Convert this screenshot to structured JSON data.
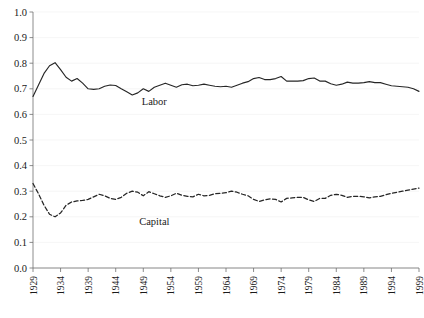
{
  "chart_data": {
    "type": "line",
    "title": "",
    "subtitle": "",
    "xlabel": "",
    "ylabel": "",
    "xlim": [
      1929,
      1999
    ],
    "ylim": [
      0.0,
      1.0
    ],
    "grid": true,
    "grid_axis": "y",
    "legend": "inline-annotations",
    "legend_position": "inside-plot",
    "y_ticks": [
      "0.0",
      "0.1",
      "0.2",
      "0.3",
      "0.4",
      "0.5",
      "0.6",
      "0.7",
      "0.8",
      "0.9",
      "1.0"
    ],
    "y_tick_values": [
      0.0,
      0.1,
      0.2,
      0.3,
      0.4,
      0.5,
      0.6,
      0.7,
      0.8,
      0.9,
      1.0
    ],
    "x_ticks": [
      "1929",
      "1934",
      "1939",
      "1944",
      "1949",
      "1954",
      "1959",
      "1964",
      "1969",
      "1974",
      "1979",
      "1984",
      "1989",
      "1994",
      "1999"
    ],
    "x_tick_values": [
      1929,
      1934,
      1939,
      1944,
      1949,
      1954,
      1959,
      1964,
      1969,
      1974,
      1979,
      1984,
      1989,
      1994,
      1999
    ],
    "x": [
      1929,
      1930,
      1931,
      1932,
      1933,
      1934,
      1935,
      1936,
      1937,
      1938,
      1939,
      1940,
      1941,
      1942,
      1943,
      1944,
      1945,
      1946,
      1947,
      1948,
      1949,
      1950,
      1951,
      1952,
      1953,
      1954,
      1955,
      1956,
      1957,
      1958,
      1959,
      1960,
      1961,
      1962,
      1963,
      1964,
      1965,
      1966,
      1967,
      1968,
      1969,
      1970,
      1971,
      1972,
      1973,
      1974,
      1975,
      1976,
      1977,
      1978,
      1979,
      1980,
      1981,
      1982,
      1983,
      1984,
      1985,
      1986,
      1987,
      1988,
      1989,
      1990,
      1991,
      1992,
      1993,
      1994,
      1995,
      1996,
      1997,
      1998,
      1999
    ],
    "series": [
      {
        "name": "Labor",
        "style": "solid",
        "color": "#262626",
        "annotation_label": "Labor",
        "values": [
          0.67,
          0.715,
          0.76,
          0.79,
          0.802,
          0.775,
          0.745,
          0.73,
          0.74,
          0.722,
          0.7,
          0.698,
          0.7,
          0.71,
          0.715,
          0.713,
          0.7,
          0.688,
          0.676,
          0.684,
          0.7,
          0.69,
          0.706,
          0.714,
          0.722,
          0.714,
          0.706,
          0.716,
          0.718,
          0.712,
          0.714,
          0.718,
          0.714,
          0.71,
          0.708,
          0.71,
          0.706,
          0.714,
          0.722,
          0.728,
          0.74,
          0.744,
          0.736,
          0.736,
          0.74,
          0.748,
          0.73,
          0.73,
          0.73,
          0.732,
          0.74,
          0.742,
          0.73,
          0.73,
          0.72,
          0.714,
          0.718,
          0.726,
          0.722,
          0.722,
          0.724,
          0.728,
          0.724,
          0.724,
          0.718,
          0.712,
          0.71,
          0.708,
          0.706,
          0.7,
          0.69
        ]
      },
      {
        "name": "Capital",
        "style": "dashed",
        "color": "#262626",
        "annotation_label": "Capital",
        "values": [
          0.33,
          0.29,
          0.245,
          0.21,
          0.2,
          0.215,
          0.245,
          0.258,
          0.262,
          0.264,
          0.268,
          0.278,
          0.288,
          0.282,
          0.272,
          0.268,
          0.276,
          0.292,
          0.3,
          0.296,
          0.282,
          0.298,
          0.29,
          0.282,
          0.276,
          0.282,
          0.292,
          0.284,
          0.28,
          0.278,
          0.288,
          0.282,
          0.284,
          0.29,
          0.292,
          0.294,
          0.3,
          0.296,
          0.288,
          0.282,
          0.268,
          0.26,
          0.266,
          0.27,
          0.268,
          0.258,
          0.272,
          0.274,
          0.276,
          0.276,
          0.266,
          0.26,
          0.272,
          0.272,
          0.284,
          0.288,
          0.284,
          0.276,
          0.28,
          0.28,
          0.278,
          0.274,
          0.278,
          0.28,
          0.286,
          0.292,
          0.296,
          0.3,
          0.304,
          0.308,
          0.312
        ]
      }
    ],
    "annotations": [
      {
        "text": "Labor",
        "x": 1951,
        "y": 0.636
      },
      {
        "text": "Capital",
        "x": 1951,
        "y": 0.168
      }
    ],
    "colors": {
      "axis": "#6e6e6e",
      "gridline": "#f2f2f2",
      "series_line": "#262626",
      "tick_label": "#1a1a1a",
      "background": "#ffffff"
    }
  }
}
